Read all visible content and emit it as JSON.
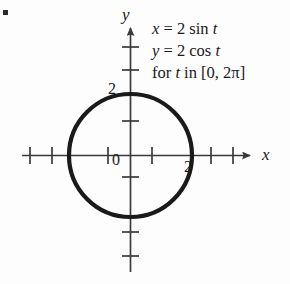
{
  "figure": {
    "bullet": "•",
    "caption_equations": {
      "line1": "x = 2 sin t",
      "line2": "y = 2 cos t",
      "line3": "for t in [0, 2π]"
    },
    "axes": {
      "x_axis_label": "x",
      "y_axis_label": "y",
      "origin_label": "0",
      "x_tick_label": "2",
      "y_tick_label": "2"
    },
    "colors": {
      "curve": "#1a1a1a",
      "axis": "#3a3a3a",
      "text": "#1a1a1a",
      "background": "#fdfdfd"
    }
  },
  "chart_data": {
    "type": "line",
    "title": "",
    "subtitle": "",
    "xlabel": "x",
    "ylabel": "y",
    "xlim": [
      -3.4,
      4.0
    ],
    "ylim": [
      -4.2,
      4.2
    ],
    "grid": false,
    "legend": null,
    "annotations": [
      "x = 2 sin t",
      "y = 2 cos t",
      "for t in [0, 2π]"
    ],
    "parametric": {
      "x_expression": "2 sin t",
      "y_expression": "2 cos t",
      "t_domain": [
        0,
        6.283185307179586
      ],
      "t_domain_label": "[0, 2π]",
      "amplitude": 2,
      "shape": "circle",
      "center": [
        0,
        0
      ],
      "radius": 2
    },
    "series": [
      {
        "name": "x = 2 sin t, y = 2 cos t",
        "x": [
          0,
          1,
          1.414,
          1.732,
          2,
          1.732,
          1.414,
          1,
          0,
          -1,
          -1.414,
          -1.732,
          -2,
          -1.732,
          -1.414,
          -1,
          0
        ],
        "y": [
          2,
          1.732,
          1.414,
          1,
          0,
          -1,
          -1.414,
          -1.732,
          -2,
          -1.732,
          -1.414,
          -1,
          0,
          1,
          1.414,
          1.732,
          2
        ]
      }
    ],
    "labeled_points": [
      {
        "label": "2",
        "x": 2,
        "y": 0
      },
      {
        "label": "2",
        "x": 0,
        "y": 2
      },
      {
        "label": "0",
        "x": 0,
        "y": 0
      }
    ],
    "x_ticks": [
      -3.2,
      -2.5,
      -0.7,
      0.7,
      2.6,
      3.3
    ],
    "y_ticks": [
      -2.7,
      -3.5,
      3.5,
      2.7
    ]
  }
}
